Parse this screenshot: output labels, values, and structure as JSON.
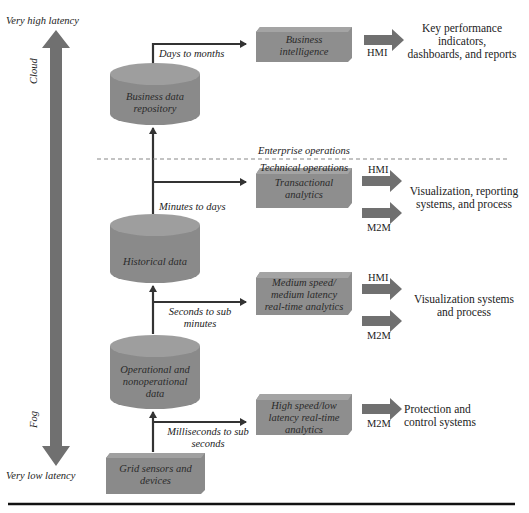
{
  "latency_axis": {
    "top_label": "Very high latency",
    "bottom_label": "Very low latency",
    "upper_zone": "Cloud",
    "lower_zone": "Fog"
  },
  "data_stores": [
    {
      "id": "business-data-repository",
      "label_lines": [
        "Business data",
        "repository"
      ]
    },
    {
      "id": "historical-data",
      "label_lines": [
        "Historical data"
      ]
    },
    {
      "id": "operational-data",
      "label_lines": [
        "Operational and",
        "nonoperational",
        "data"
      ]
    }
  ],
  "source": {
    "label_lines": [
      "Grid sensors and",
      "devices"
    ]
  },
  "analytics": [
    {
      "id": "business-intelligence",
      "label_lines": [
        "Business",
        "intelligence"
      ],
      "timescale": "Days to months"
    },
    {
      "id": "transactional-analytics",
      "label_lines": [
        "Transactional",
        "analytics"
      ],
      "timescale": "Minutes to days"
    },
    {
      "id": "medium-speed-analytics",
      "label_lines": [
        "Medium speed/",
        "medium latency",
        "real-time analytics"
      ],
      "timescale_lines": [
        "Seconds to sub",
        "minutes"
      ]
    },
    {
      "id": "high-speed-analytics",
      "label_lines": [
        "High speed/low",
        "latency real-time",
        "analytics"
      ],
      "timescale_lines": [
        "Milliseconds to sub",
        "seconds"
      ]
    }
  ],
  "divider": {
    "above_label": "Enterprise operations",
    "below_label": "Technical operations"
  },
  "interfaces": {
    "hmi": "HMI",
    "m2m": "M2M"
  },
  "outputs": [
    {
      "id": "kpi-output",
      "label_lines": [
        "Key performance",
        "indicators,",
        "dashboards, and reports"
      ]
    },
    {
      "id": "visualization-reporting-output",
      "label_lines": [
        "Visualization, reporting",
        "systems, and process"
      ]
    },
    {
      "id": "visualization-systems-output",
      "label_lines": [
        "Visualization systems",
        "and process"
      ]
    },
    {
      "id": "protection-control-output",
      "label_lines": [
        "Protection and",
        "control systems"
      ]
    }
  ],
  "colors": {
    "shape_fill": "#8a8a8a",
    "shape_fill_light": "#9a9a9a",
    "shape_top": "#a2a2a2",
    "arrow_fill": "#6e6e6e",
    "line": "#333333",
    "divider": "#888888"
  }
}
